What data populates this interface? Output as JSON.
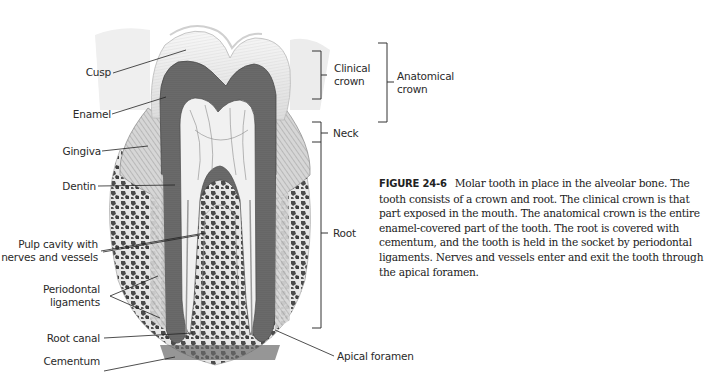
{
  "figure": {
    "number": "FIGURE 24-6",
    "caption": "Molar tooth in place in the alveolar bone. The tooth consists of a crown and root. The clinical crown is that part exposed in the mouth. The anatomical crown is the entire enamel-covered part of the tooth. The root is covered with cementum, and the tooth is held in the socket by periodontal ligaments. Nerves and vessels enter and exit the tooth through the apical foramen."
  },
  "labels_left": {
    "cusp": "Cusp",
    "enamel": "Enamel",
    "gingiva": "Gingiva",
    "dentin": "Dentin",
    "pulp_line1": "Pulp cavity with",
    "pulp_line2": "nerves and vessels",
    "periodontal_ligaments_line1": "Periodontal",
    "periodontal_ligaments_line2": "ligaments",
    "root_canal": "Root canal",
    "cementum": "Cementum",
    "alveolar_bone": "Alveolar bone",
    "periodontal_membrane_line1": "Periodontal",
    "periodontal_membrane_line2": "membrane"
  },
  "labels_right": {
    "clinical_crown_line1": "Clinical",
    "clinical_crown_line2": "crown",
    "anatomical_crown_line1": "Anatomical",
    "anatomical_crown_line2": "crown",
    "neck": "Neck",
    "root": "Root",
    "apical_foramen": "Apical foramen"
  },
  "colors": {
    "dentin": "#6e6e6e",
    "enamel": "#e9e9e9",
    "pulp": "#f2f2f2",
    "bone": "#4a4a4a",
    "leader": "#222222"
  }
}
